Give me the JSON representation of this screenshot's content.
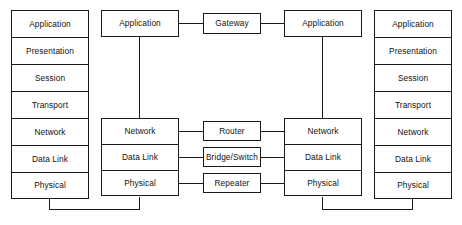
{
  "diagram": {
    "type": "network-layer-diagram",
    "colors": {
      "stroke": "#1a1a1a",
      "fill": "#ffffff",
      "text": "#111111"
    },
    "host_left": {
      "name": "left-host-stack",
      "layers": [
        "Application",
        "Presentation",
        "Session",
        "Transport",
        "Network",
        "Data Link",
        "Physical"
      ]
    },
    "host_right": {
      "name": "right-host-stack",
      "layers": [
        "Application",
        "Presentation",
        "Session",
        "Transport",
        "Network",
        "Data Link",
        "Physical"
      ]
    },
    "node_mid_left": {
      "name": "middle-left-node",
      "top_layer": "Application",
      "lower_layers": [
        "Network",
        "Data Link",
        "Physical"
      ]
    },
    "node_mid_right": {
      "name": "middle-right-node",
      "top_layer": "Application",
      "lower_layers": [
        "Network",
        "Data Link",
        "Physical"
      ]
    },
    "devices": [
      {
        "label": "Gateway",
        "maps_to": "Application"
      },
      {
        "label": "Router",
        "maps_to": "Network"
      },
      {
        "label": "Bridge/Switch",
        "maps_to": "Data Link"
      },
      {
        "label": "Repeater",
        "maps_to": "Physical"
      }
    ]
  }
}
